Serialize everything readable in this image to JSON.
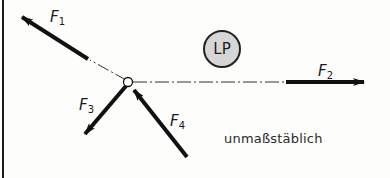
{
  "diagram": {
    "type": "force-diagram",
    "node": {
      "x": 128,
      "y": 82,
      "label": ""
    },
    "lp_marker": {
      "label": "LP",
      "cx": 222,
      "cy": 49,
      "r": 18,
      "fill": "#d6d6d6"
    },
    "forces": [
      {
        "id": "F1",
        "name": "F",
        "sub": "1",
        "direction": "up-left, pointing away from node"
      },
      {
        "id": "F2",
        "name": "F",
        "sub": "2",
        "direction": "right, pointing away from node"
      },
      {
        "id": "F3",
        "name": "F",
        "sub": "3",
        "direction": "down-left, pointing away from node"
      },
      {
        "id": "F4",
        "name": "F",
        "sub": "4",
        "direction": "from lower-right, pointing toward node"
      }
    ],
    "note": "unmaßstäblich",
    "colors": {
      "line": "#111111",
      "background": "#fdfdfb",
      "lp_fill": "#d6d6d6"
    }
  }
}
